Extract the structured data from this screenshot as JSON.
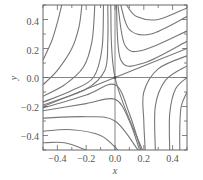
{
  "chart_data": {
    "type": "line",
    "title": "",
    "subtitle": "Phase portrait (streamlines) around a saddle point at the origin",
    "xlabel": "x",
    "ylabel": "y",
    "xlim": [
      -0.5,
      0.5
    ],
    "ylim": [
      -0.5,
      0.5
    ],
    "xticks": [
      -0.4,
      -0.2,
      0.0,
      0.2,
      0.4
    ],
    "yticks": [
      0.4,
      0.2,
      0.0,
      -0.2,
      -0.4
    ],
    "xtick_labels": [
      "−0.4",
      "−0.2",
      "0.0",
      "0.2",
      "0.4"
    ],
    "ytick_labels": [
      "0.4",
      "0.2",
      "0.0",
      "−0.2",
      "−0.4"
    ],
    "grid": false,
    "axis_lines": {
      "x_zero": true,
      "y_zero": true
    },
    "fixed_point": {
      "x": 0.0,
      "y": 0.0,
      "kind": "saddle"
    },
    "line_color": "#777777",
    "series": [
      {
        "name": "tl-1",
        "points": [
          [
            -0.5,
            0.12
          ],
          [
            -0.44,
            0.25
          ],
          [
            -0.4,
            0.38
          ],
          [
            -0.37,
            0.5
          ]
        ]
      },
      {
        "name": "tl-2",
        "points": [
          [
            -0.5,
            -0.05
          ],
          [
            -0.4,
            0.05
          ],
          [
            -0.3,
            0.2
          ],
          [
            -0.25,
            0.35
          ],
          [
            -0.23,
            0.5
          ]
        ]
      },
      {
        "name": "tl-3",
        "points": [
          [
            -0.5,
            -0.13
          ],
          [
            -0.35,
            -0.05
          ],
          [
            -0.22,
            0.07
          ],
          [
            -0.16,
            0.25
          ],
          [
            -0.14,
            0.5
          ]
        ]
      },
      {
        "name": "tl-4",
        "points": [
          [
            -0.5,
            -0.17
          ],
          [
            -0.3,
            -0.09
          ],
          [
            -0.15,
            0.0
          ],
          [
            -0.09,
            0.2
          ],
          [
            -0.08,
            0.5
          ]
        ]
      },
      {
        "name": "tl-5",
        "points": [
          [
            -0.5,
            -0.19
          ],
          [
            -0.2,
            -0.08
          ],
          [
            -0.07,
            0.05
          ],
          [
            -0.05,
            0.25
          ],
          [
            -0.05,
            0.5
          ]
        ]
      },
      {
        "name": "tr-1",
        "points": [
          [
            0.08,
            0.5
          ],
          [
            0.15,
            0.42
          ],
          [
            0.3,
            0.4
          ],
          [
            0.5,
            0.48
          ]
        ]
      },
      {
        "name": "tr-2",
        "points": [
          [
            0.04,
            0.5
          ],
          [
            0.1,
            0.33
          ],
          [
            0.25,
            0.3
          ],
          [
            0.5,
            0.42
          ]
        ]
      },
      {
        "name": "tr-3",
        "points": [
          [
            0.02,
            0.5
          ],
          [
            0.07,
            0.22
          ],
          [
            0.2,
            0.19
          ],
          [
            0.5,
            0.32
          ]
        ]
      },
      {
        "name": "tr-4",
        "points": [
          [
            0.01,
            0.5
          ],
          [
            0.04,
            0.12
          ],
          [
            0.2,
            0.1
          ],
          [
            0.5,
            0.25
          ]
        ]
      },
      {
        "name": "unstable-manifold",
        "points": [
          [
            -0.5,
            -0.2
          ],
          [
            0.0,
            0.0
          ],
          [
            0.5,
            0.2
          ]
        ]
      },
      {
        "name": "stable-manifold",
        "points": [
          [
            -0.03,
            0.5
          ],
          [
            0.0,
            0.0
          ],
          [
            0.19,
            -0.5
          ]
        ]
      },
      {
        "name": "bl-1",
        "points": [
          [
            -0.5,
            -0.21
          ],
          [
            -0.2,
            -0.12
          ],
          [
            0.0,
            -0.05
          ],
          [
            0.1,
            -0.25
          ],
          [
            0.18,
            -0.5
          ]
        ]
      },
      {
        "name": "bl-2",
        "points": [
          [
            -0.5,
            -0.23
          ],
          [
            -0.2,
            -0.18
          ],
          [
            0.0,
            -0.15
          ],
          [
            0.1,
            -0.3
          ],
          [
            0.17,
            -0.5
          ]
        ]
      },
      {
        "name": "bl-3",
        "points": [
          [
            -0.5,
            -0.28
          ],
          [
            -0.2,
            -0.27
          ],
          [
            0.0,
            -0.3
          ],
          [
            0.16,
            -0.5
          ]
        ]
      },
      {
        "name": "bl-4",
        "points": [
          [
            -0.5,
            -0.37
          ],
          [
            -0.3,
            -0.36
          ],
          [
            -0.1,
            -0.4
          ],
          [
            0.02,
            -0.5
          ]
        ]
      },
      {
        "name": "bl-5",
        "points": [
          [
            -0.5,
            -0.45
          ],
          [
            -0.35,
            -0.45
          ],
          [
            -0.2,
            -0.5
          ]
        ]
      },
      {
        "name": "br-1",
        "points": [
          [
            0.5,
            0.15
          ],
          [
            0.3,
            0.06
          ],
          [
            0.2,
            -0.1
          ],
          [
            0.2,
            -0.3
          ],
          [
            0.21,
            -0.5
          ]
        ]
      },
      {
        "name": "br-2",
        "points": [
          [
            0.5,
            0.08
          ],
          [
            0.35,
            -0.02
          ],
          [
            0.28,
            -0.2
          ],
          [
            0.28,
            -0.5
          ]
        ]
      },
      {
        "name": "br-3",
        "points": [
          [
            0.5,
            0.0
          ],
          [
            0.42,
            -0.08
          ],
          [
            0.38,
            -0.25
          ],
          [
            0.38,
            -0.5
          ]
        ]
      },
      {
        "name": "br-4",
        "points": [
          [
            0.5,
            -0.1
          ],
          [
            0.46,
            -0.2
          ],
          [
            0.45,
            -0.35
          ],
          [
            0.45,
            -0.5
          ]
        ]
      }
    ]
  },
  "labels": {
    "xlabel": "x",
    "ylabel": "y",
    "xtick_0": "−0.4",
    "xtick_1": "−0.2",
    "xtick_2": "0.0",
    "xtick_3": "0.2",
    "xtick_4": "0.4",
    "ytick_0": "0.4",
    "ytick_1": "0.2",
    "ytick_2": "0.0",
    "ytick_3": "−0.2",
    "ytick_4": "−0.4"
  }
}
